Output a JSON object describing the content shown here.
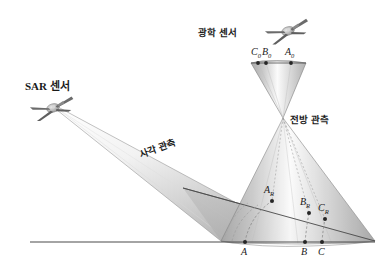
{
  "figure": {
    "background_color": "#ffffff",
    "width": 388,
    "height": 276
  },
  "labels": {
    "optical_sensor": "광학 센서",
    "sar_sensor": "SAR 센서",
    "forward_observation": "전방 관측",
    "oblique_observation": "사각 관측"
  },
  "points": {
    "optical_image": [
      {
        "id": "C0",
        "text": "C",
        "sub": "0",
        "x": 258,
        "y": 63,
        "label_x": 252,
        "label_y": 50
      },
      {
        "id": "B0",
        "text": "B",
        "sub": "0",
        "x": 266,
        "y": 63,
        "label_x": 264,
        "label_y": 50
      },
      {
        "id": "A0",
        "text": "A",
        "sub": "0",
        "x": 291,
        "y": 63,
        "label_x": 285,
        "label_y": 50
      }
    ],
    "slant_range": [
      {
        "id": "AR",
        "text": "A",
        "sub": "R",
        "x": 272,
        "y": 201,
        "label_x": 266,
        "label_y": 187
      },
      {
        "id": "BR",
        "text": "B",
        "sub": "R",
        "x": 309,
        "y": 213,
        "label_x": 302,
        "label_y": 199
      },
      {
        "id": "CR",
        "text": "C",
        "sub": "R",
        "x": 325,
        "y": 219,
        "label_x": 320,
        "label_y": 205
      }
    ],
    "ground": [
      {
        "id": "A",
        "text": "A",
        "sub": "",
        "x": 245,
        "y": 242,
        "label_x": 241,
        "label_y": 246
      },
      {
        "id": "B",
        "text": "B",
        "sub": "",
        "x": 305,
        "y": 242,
        "label_x": 301,
        "label_y": 246
      },
      {
        "id": "C",
        "text": "C",
        "sub": "",
        "x": 322,
        "y": 242,
        "label_x": 318,
        "label_y": 246
      }
    ]
  },
  "aircraft": {
    "optical": {
      "x": 288,
      "y": 31,
      "name": "optical-sensor-aircraft"
    },
    "sar": {
      "x": 53,
      "y": 108,
      "name": "sar-sensor-aircraft"
    }
  },
  "geometry": {
    "apex_x": 283,
    "apex_y": 118,
    "ground_line_y": 242,
    "ground_line_x1": 30,
    "ground_line_x2": 375
  },
  "colors": {
    "line": "#4a4a4a",
    "text": "#1a1a1a",
    "cone_light": "#fdfdfd",
    "cone_mid": "#cfcfcf",
    "cone_dark": "#a8a8a8",
    "ground_plane": "#b9b9b9",
    "dashed": "#8e8e8e",
    "point_fill": "#2a2a2a"
  }
}
